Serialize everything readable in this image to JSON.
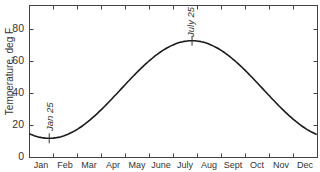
{
  "chart_data": {
    "type": "line",
    "title": "",
    "xlabel": "",
    "ylabel": "Temperature, deg F",
    "ylim": [
      0,
      95
    ],
    "yticks": [
      0,
      20,
      40,
      60,
      80
    ],
    "categories": [
      "Jan",
      "Feb",
      "Mar",
      "Apr",
      "May",
      "June",
      "July",
      "Aug",
      "Sept",
      "Oct",
      "Nov",
      "Dec"
    ],
    "grid": false,
    "legend": null,
    "series": [
      {
        "name": "Temperature",
        "x": [
          "Jan 1",
          "Jan 25",
          "Feb 15",
          "Mar 15",
          "Apr 15",
          "May 15",
          "June 15",
          "July 25",
          "Aug 15",
          "Sept 15",
          "Oct 15",
          "Nov 15",
          "Dec 15",
          "Dec 31"
        ],
        "values": [
          16,
          12,
          14,
          25,
          40,
          55,
          68,
          73,
          71,
          62,
          48,
          32,
          20,
          16
        ]
      }
    ],
    "annotations": [
      {
        "text": "Jan 25",
        "x": "Jan 25",
        "y": 12,
        "marker": "tick-cross"
      },
      {
        "text": "July 25",
        "x": "July 25",
        "y": 73,
        "marker": "tick-cross"
      }
    ],
    "curve_model": {
      "mean": 42.5,
      "amplitude": 30.5,
      "min_day": 25,
      "max_day": 206
    }
  },
  "labels": {
    "ylabel": "Temperature, deg F",
    "yticks": [
      "0",
      "20",
      "40",
      "60",
      "80"
    ],
    "months": [
      "Jan",
      "Feb",
      "Mar",
      "Apr",
      "May",
      "June",
      "July",
      "Aug",
      "Sept",
      "Oct",
      "Nov",
      "Dec"
    ],
    "annot_min": "Jan 25",
    "annot_max": "July 25"
  },
  "colors": {
    "line": "#1a1a1a",
    "axis": "#333333",
    "background": "#ffffff"
  }
}
